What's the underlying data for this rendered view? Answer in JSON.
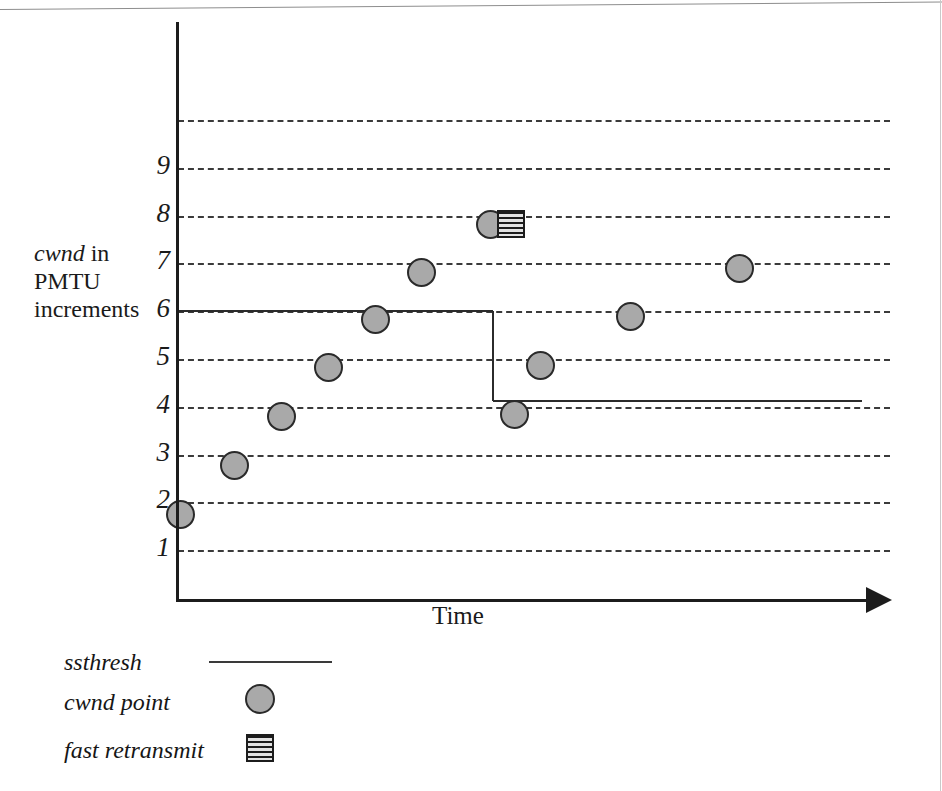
{
  "chart_data": {
    "type": "scatter",
    "title": "",
    "xlabel": "Time",
    "ylabel": "cwnd in PMTU increments",
    "ylabel_parts": {
      "italic": "cwnd",
      "rest": " in PMTU increments"
    },
    "grid": true,
    "xlim": [
      0,
      10
    ],
    "ylim": [
      0,
      10.6
    ],
    "yticks": [
      1,
      2,
      3,
      4,
      5,
      6,
      7,
      8,
      9
    ],
    "ytick_labels": [
      "1",
      "2",
      "3",
      "4",
      "5",
      "6",
      "7",
      "8",
      "9"
    ],
    "gridlines": [
      1,
      2,
      3,
      4,
      5,
      6,
      7,
      8,
      9,
      10
    ],
    "xticks": [],
    "xtick_labels": [],
    "series": [
      {
        "name": "cwnd point",
        "type": "scatter",
        "marker": "circle",
        "color": "#a9a9a9",
        "edge_color": "#2a2a2a",
        "x": [
          0.03,
          0.8,
          1.46,
          2.11,
          2.77,
          3.42,
          4.39,
          4.72,
          5.09,
          6.35,
          7.88
        ],
        "y": [
          1.75,
          2.78,
          3.8,
          4.82,
          5.82,
          6.82,
          7.82,
          3.84,
          4.86,
          5.88,
          6.9
        ]
      },
      {
        "name": "fast retransmit",
        "type": "scatter",
        "marker": "striped-square",
        "color": "#1c1c1c",
        "x": [
          4.68
        ],
        "y": [
          7.82
        ]
      },
      {
        "name": "ssthresh",
        "type": "step",
        "color": "#2b2b2b",
        "x": [
          0.0,
          4.42,
          4.42,
          9.6
        ],
        "y": [
          6.0,
          6.0,
          4.12,
          4.12
        ]
      }
    ]
  },
  "axes": {
    "x_title": "Time",
    "y_title_italic": "cwnd",
    "y_title_rest": " in",
    "y_title_line2": "PMTU",
    "y_title_line3": "increments"
  },
  "legend": {
    "position": "below-left",
    "items": [
      {
        "label": "ssthresh",
        "marker": "line"
      },
      {
        "label": "cwnd point",
        "marker": "circle"
      },
      {
        "label": "fast retransmit",
        "marker": "striped-square"
      }
    ]
  },
  "colors": {
    "marker_fill": "#a9a9a9",
    "marker_edge": "#2a2a2a",
    "line": "#2b2b2b",
    "grid": "#3a3a3a",
    "axis": "#1c1c1c",
    "background": "#ffffff"
  }
}
